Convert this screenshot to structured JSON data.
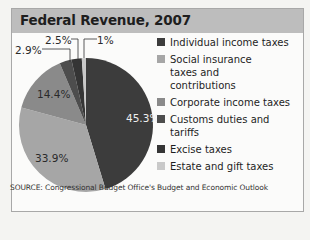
{
  "header": {
    "title": "Federal Revenue, 2007"
  },
  "chart_data": {
    "type": "pie",
    "title": "Federal Revenue, 2007",
    "categories": [
      "Individual income taxes",
      "Social insurance taxes and contributions",
      "Corporate income taxes",
      "Customs duties and tariffs",
      "Excise taxes",
      "Estate and gift taxes"
    ],
    "values": [
      45.3,
      33.9,
      14.4,
      2.9,
      2.5,
      1.0
    ],
    "value_labels": [
      "45.3%",
      "33.9%",
      "14.4%",
      "2.9%",
      "2.5%",
      "1%"
    ],
    "colors": [
      "#3c3c3c",
      "#a6a6a6",
      "#8a8a8a",
      "#4d4d4d",
      "#353535",
      "#c9c9c9"
    ],
    "legend_position": "right",
    "source": "SOURCE: Congressional Budget Office's Budget and Economic Outlook"
  },
  "legend": {
    "items": [
      {
        "label": "Individual income taxes",
        "color": "#3c3c3c"
      },
      {
        "label": "Social insurance taxes and contributions",
        "color": "#a6a6a6"
      },
      {
        "label": "Corporate income taxes",
        "color": "#8a8a8a"
      },
      {
        "label": "Customs duties and tariffs",
        "color": "#4d4d4d"
      },
      {
        "label": "Excise taxes",
        "color": "#353535"
      },
      {
        "label": "Estate and gift taxes",
        "color": "#c9c9c9"
      }
    ]
  },
  "labels": {
    "individual": "45.3%",
    "social": "33.9%",
    "corporate": "14.4%",
    "customs": "2.9%",
    "excise": "2.5%",
    "estate": "1%"
  },
  "footer": {
    "source": "SOURCE: Congressional Budget Office's Budget and Economic Outlook"
  }
}
